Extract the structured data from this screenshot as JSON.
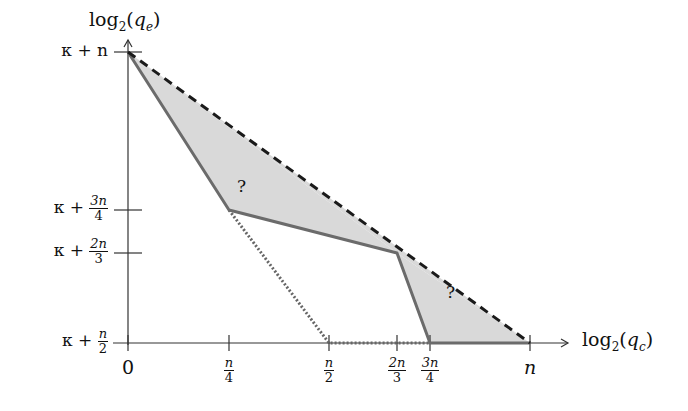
{
  "diagram": {
    "y_axis_label": {
      "base": "log",
      "sub": "2",
      "arg": "q",
      "arg_sub": "e"
    },
    "x_axis_label": {
      "base": "log",
      "sub": "2",
      "arg": "q",
      "arg_sub": "c"
    },
    "y_ticks": [
      {
        "prefix": "κ + ",
        "num": "n",
        "den": "",
        "plain": "κ + n",
        "y": 52
      },
      {
        "prefix": "κ + ",
        "num": "3n",
        "den": "4",
        "y": 210
      },
      {
        "prefix": "κ + ",
        "num": "2n",
        "den": "3",
        "y": 253
      },
      {
        "prefix": "κ + ",
        "num": "n",
        "den": "2",
        "y": 343
      }
    ],
    "x_ticks": [
      {
        "label": "0",
        "x": 128
      },
      {
        "num": "n",
        "den": "4",
        "x": 229
      },
      {
        "num": "n",
        "den": "2",
        "x": 329
      },
      {
        "num": "2n",
        "den": "3",
        "x": 397
      },
      {
        "num": "3n",
        "den": "4",
        "x": 430
      },
      {
        "label": "n",
        "x": 530
      }
    ],
    "region_labels": [
      "?",
      "?"
    ],
    "colors": {
      "fill": "#d9d9d9",
      "solid_line": "#6b6b6b",
      "dashed_line": "#1a1a1a",
      "dotted_line": "#666666",
      "axis": "#333333"
    }
  }
}
